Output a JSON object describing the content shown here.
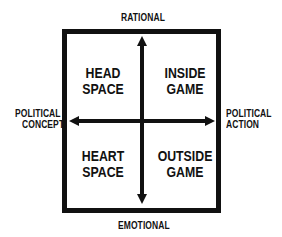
{
  "axes": {
    "top": "RATIONAL",
    "bottom": "EMOTIONAL",
    "left": [
      "POLITICAL",
      "CONCEPT"
    ],
    "right": [
      "POLITICAL",
      "ACTION"
    ]
  },
  "quadrants": {
    "top_left": [
      "HEAD",
      "SPACE"
    ],
    "top_right": [
      "INSIDE",
      "GAME"
    ],
    "bottom_left": [
      "HEART",
      "SPACE"
    ],
    "bottom_right": [
      "OUTSIDE",
      "GAME"
    ]
  },
  "colors": {
    "ink": "#111111",
    "background": "#ffffff"
  }
}
